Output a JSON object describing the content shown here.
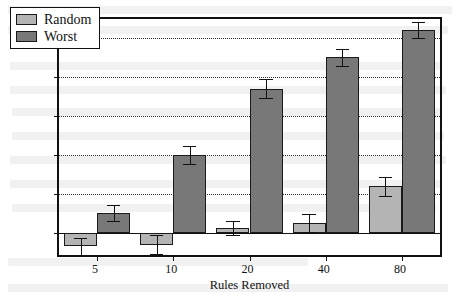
{
  "chart_data": {
    "type": "bar",
    "title": "",
    "xlabel": "Rules Removed",
    "ylabel": "% Improvement",
    "categories": [
      "5",
      "10",
      "20",
      "40",
      "80"
    ],
    "series": [
      {
        "name": "Random",
        "color": "#b4b4b4",
        "values": [
          -1.7,
          -1.5,
          0.6,
          1.3,
          6.0
        ],
        "errors": [
          1.1,
          1.2,
          0.9,
          1.1,
          1.2
        ]
      },
      {
        "name": "Worst",
        "color": "#787878",
        "values": [
          2.6,
          10.0,
          18.5,
          22.5,
          26.0
        ],
        "errors": [
          1.0,
          1.2,
          1.2,
          1.1,
          1.0
        ]
      }
    ],
    "ylim": [
      -2.8,
      27.4
    ],
    "yticks": [
      0,
      5,
      10,
      15,
      20,
      25
    ],
    "ytick_labels": [
      "0%",
      "5%",
      "10%",
      "15%",
      "20%",
      "25%"
    ],
    "grid": true,
    "grid_style": "dotted",
    "legend_position": "upper left",
    "error_bars": true
  },
  "legend": {
    "entries": [
      {
        "label": "Random"
      },
      {
        "label": "Worst"
      }
    ]
  },
  "axes": {
    "x_title": "Rules Removed",
    "y_title": "% Improvement"
  }
}
